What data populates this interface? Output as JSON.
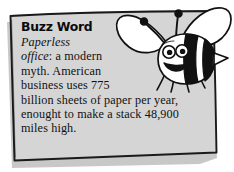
{
  "card": {
    "name": "buzz-word-callout",
    "headline": "Buzz Word",
    "fill_color": "#d5d5d5",
    "border_color": "#1a1a1a",
    "page_background": "#ffffff",
    "shadow_color": "#9a9a9a",
    "body_lines": [
      {
        "italic": "Paperless",
        "roman": ""
      },
      {
        "italic": "office",
        "roman": ": a modern"
      },
      {
        "italic": "",
        "roman": "myth. American"
      },
      {
        "italic": "",
        "roman": "business uses 775"
      },
      {
        "italic": "",
        "roman": "billion sheets of paper per year,"
      },
      {
        "italic": "",
        "roman": "enought to make a stack 48,900"
      },
      {
        "italic": "",
        "roman": "miles high."
      }
    ],
    "full_text": "Paperless office: a modern myth. American business uses 775 billion sheets of paper per year, enought to make a stack 48,900 miles high.",
    "figures": {
      "paper_sheets": "775 billion",
      "stack_height_miles": "48,900"
    }
  },
  "illustration": {
    "name": "cartoon-bee",
    "description": "smiling cartoon bee with two wings, two antennae, striped body and stinger",
    "body_stripe_color": "#111111",
    "wing_color": "#ffffff",
    "parts": [
      "left-wing",
      "right-wing",
      "antenna-left",
      "antenna-right",
      "head",
      "eyes",
      "mouth",
      "striped-abdomen",
      "stinger",
      "legs"
    ]
  }
}
